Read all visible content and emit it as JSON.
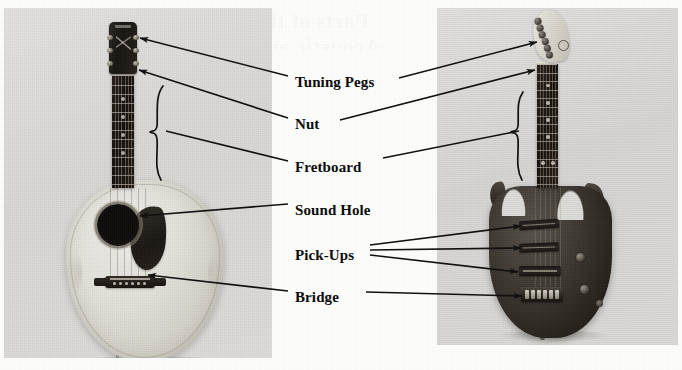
{
  "page": {
    "background_color": "#fdfdfb",
    "ghost_text_line1": "Parts of the Guitar",
    "ghost_text_line2": "Acoustic and Electric"
  },
  "photos": [
    {
      "id": "photo-acoustic",
      "name": "acoustic-guitar-photo",
      "alt": "Black-and-white photograph of an acoustic steel-string guitar standing upright",
      "instrument": "Acoustic Guitar",
      "background_color": "#dedddb"
    },
    {
      "id": "photo-electric",
      "name": "electric-guitar-photo",
      "alt": "Black-and-white photograph of a solid-body electric guitar standing upright",
      "instrument": "Electric Guitar",
      "background_color": "#dedddb"
    }
  ],
  "labels": [
    {
      "id": "tuning-pegs",
      "text": "Tuning Pegs",
      "x": 295,
      "y": 75
    },
    {
      "id": "nut",
      "text": "Nut",
      "x": 295,
      "y": 117
    },
    {
      "id": "fretboard",
      "text": "Fretboard",
      "x": 295,
      "y": 160
    },
    {
      "id": "sound-hole",
      "text": "Sound Hole",
      "x": 295,
      "y": 203
    },
    {
      "id": "pick-ups",
      "text": "Pick-Ups",
      "x": 295,
      "y": 248
    },
    {
      "id": "bridge",
      "text": "Bridge",
      "x": 295,
      "y": 290
    }
  ],
  "leader_lines": [
    {
      "label": "tuning-pegs",
      "target": "acoustic-headstock",
      "from": [
        288,
        76
      ],
      "to": [
        140,
        38
      ],
      "arrow": true
    },
    {
      "label": "tuning-pegs",
      "target": "electric-headstock",
      "from": [
        399,
        78
      ],
      "to": [
        537,
        42
      ],
      "arrow": true
    },
    {
      "label": "nut",
      "target": "acoustic-nut",
      "from": [
        288,
        118
      ],
      "to": [
        139,
        70
      ],
      "arrow": true
    },
    {
      "label": "nut",
      "target": "electric-nut",
      "from": [
        340,
        120
      ],
      "to": [
        535,
        70
      ],
      "arrow": true
    },
    {
      "label": "fretboard",
      "target": "acoustic-fretboard-brace",
      "from": [
        288,
        161
      ],
      "to": [
        166,
        131
      ],
      "arrow": false
    },
    {
      "label": "fretboard",
      "target": "electric-fretboard-brace",
      "from": [
        383,
        158
      ],
      "to": [
        519,
        131
      ],
      "arrow": false
    },
    {
      "label": "sound-hole",
      "target": "acoustic-sound-hole",
      "from": [
        288,
        204
      ],
      "to": [
        140,
        216
      ],
      "arrow": true
    },
    {
      "label": "pick-ups",
      "target": "electric-pickup-neck",
      "from": [
        370,
        245
      ],
      "to": [
        521,
        226
      ],
      "arrow": true
    },
    {
      "label": "pick-ups",
      "target": "electric-pickup-middle",
      "from": [
        370,
        250
      ],
      "to": [
        521,
        248
      ],
      "arrow": true
    },
    {
      "label": "pick-ups",
      "target": "electric-pickup-bridge",
      "from": [
        370,
        255
      ],
      "to": [
        518,
        272
      ],
      "arrow": true
    },
    {
      "label": "bridge",
      "target": "acoustic-bridge",
      "from": [
        288,
        291
      ],
      "to": [
        148,
        275
      ],
      "arrow": true
    },
    {
      "label": "bridge",
      "target": "electric-bridge",
      "from": [
        366,
        292
      ],
      "to": [
        522,
        296
      ],
      "arrow": true
    }
  ],
  "acoustic_parts": {
    "headstock": "acoustic-headstock",
    "tuning_peg_count": 6,
    "nut": "acoustic-nut",
    "fretboard": "acoustic-fretboard",
    "fret_count": 12,
    "string_count": 6,
    "sound_hole": "acoustic-sound-hole",
    "pickguard": "acoustic-pickguard",
    "bridge": "acoustic-bridge",
    "bridge_pin_count": 6
  },
  "electric_parts": {
    "headstock": "electric-headstock",
    "tuning_peg_count": 6,
    "nut": "electric-nut",
    "fretboard": "electric-fretboard",
    "fret_count": 14,
    "string_count": 6,
    "pickup_count": 3,
    "pickups": [
      "electric-pickup-neck",
      "electric-pickup-middle",
      "electric-pickup-bridge"
    ],
    "bridge": "electric-bridge",
    "knob_count": 2
  },
  "colors": {
    "ink": "#0b0b0b",
    "paper": "#fdfdfb",
    "photo_bg": "#dedddb",
    "leader_line": "#111111"
  }
}
